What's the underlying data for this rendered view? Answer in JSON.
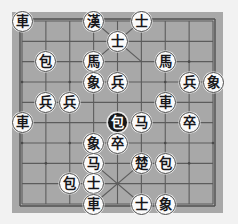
{
  "app": {
    "title": "Xiangqi Board",
    "background_color": "#f2f2f2"
  },
  "board": {
    "name": "xiangqi-board",
    "columns": 9,
    "rows": 10,
    "board_color": "#a8a8a8",
    "line_color": "#5c5c5c",
    "border_color": "#4f4f4f",
    "x": 12,
    "y": 12,
    "width": 211,
    "height": 201,
    "palaces": [
      {
        "name": "top-palace",
        "col_start": 3,
        "col_end": 5,
        "row_start": 0,
        "row_end": 2
      },
      {
        "name": "bottom-palace",
        "col_start": 3,
        "col_end": 5,
        "row_start": 7,
        "row_end": 9
      }
    ],
    "star_points": [
      {
        "col": 1,
        "row": 2
      },
      {
        "col": 7,
        "row": 2
      },
      {
        "col": 0,
        "row": 3
      },
      {
        "col": 2,
        "row": 3
      },
      {
        "col": 4,
        "row": 3
      },
      {
        "col": 6,
        "row": 3
      },
      {
        "col": 8,
        "row": 3
      },
      {
        "col": 0,
        "row": 6
      },
      {
        "col": 2,
        "row": 6
      },
      {
        "col": 4,
        "row": 6
      },
      {
        "col": 6,
        "row": 6
      },
      {
        "col": 8,
        "row": 6
      },
      {
        "col": 1,
        "row": 7
      },
      {
        "col": 7,
        "row": 7
      }
    ]
  },
  "pieces": [
    {
      "id": "p01",
      "glyph": "車",
      "role": "chariot",
      "side": "light",
      "selected": false,
      "col": 0,
      "row": 0
    },
    {
      "id": "p02",
      "glyph": "漢",
      "role": "general-han",
      "side": "light",
      "selected": false,
      "col": 3,
      "row": 0
    },
    {
      "id": "p03",
      "glyph": "士",
      "role": "advisor",
      "side": "light",
      "selected": false,
      "col": 5,
      "row": 0
    },
    {
      "id": "p04",
      "glyph": "士",
      "role": "advisor",
      "side": "light",
      "selected": false,
      "col": 4,
      "row": 1
    },
    {
      "id": "p05",
      "glyph": "包",
      "role": "cannon",
      "side": "light",
      "selected": false,
      "col": 1,
      "row": 2
    },
    {
      "id": "p06",
      "glyph": "馬",
      "role": "horse",
      "side": "light",
      "selected": false,
      "col": 3,
      "row": 2
    },
    {
      "id": "p07",
      "glyph": "馬",
      "role": "horse",
      "side": "light",
      "selected": false,
      "col": 6,
      "row": 2
    },
    {
      "id": "p08",
      "glyph": "象",
      "role": "elephant",
      "side": "light",
      "selected": false,
      "col": 3,
      "row": 3
    },
    {
      "id": "p09",
      "glyph": "兵",
      "role": "soldier",
      "side": "light",
      "selected": false,
      "col": 4,
      "row": 3
    },
    {
      "id": "p10",
      "glyph": "兵",
      "role": "soldier",
      "side": "light",
      "selected": false,
      "col": 7,
      "row": 3
    },
    {
      "id": "p11",
      "glyph": "象",
      "role": "elephant",
      "side": "light",
      "selected": false,
      "col": 8,
      "row": 3
    },
    {
      "id": "p12",
      "glyph": "兵",
      "role": "soldier",
      "side": "light",
      "selected": false,
      "col": 1,
      "row": 4
    },
    {
      "id": "p13",
      "glyph": "兵",
      "role": "soldier",
      "side": "light",
      "selected": false,
      "col": 2,
      "row": 4
    },
    {
      "id": "p14",
      "glyph": "車",
      "role": "chariot",
      "side": "light",
      "selected": false,
      "col": 6,
      "row": 4
    },
    {
      "id": "p15",
      "glyph": "車",
      "role": "chariot",
      "side": "light",
      "selected": false,
      "col": 0,
      "row": 5
    },
    {
      "id": "p16",
      "glyph": "包",
      "role": "cannon",
      "side": "dark",
      "selected": true,
      "col": 4,
      "row": 5
    },
    {
      "id": "p17",
      "glyph": "马",
      "role": "horse",
      "side": "light",
      "selected": false,
      "col": 5,
      "row": 5
    },
    {
      "id": "p18",
      "glyph": "卒",
      "role": "pawn",
      "side": "light",
      "selected": false,
      "col": 7,
      "row": 5
    },
    {
      "id": "p19",
      "glyph": "象",
      "role": "elephant",
      "side": "light",
      "selected": false,
      "col": 3,
      "row": 6
    },
    {
      "id": "p20",
      "glyph": "卒",
      "role": "pawn",
      "side": "light",
      "selected": false,
      "col": 4,
      "row": 6
    },
    {
      "id": "p21",
      "glyph": "马",
      "role": "horse",
      "side": "light",
      "selected": false,
      "col": 3,
      "row": 7
    },
    {
      "id": "p22",
      "glyph": "楚",
      "role": "general-chu",
      "side": "light",
      "selected": false,
      "col": 5,
      "row": 7
    },
    {
      "id": "p23",
      "glyph": "包",
      "role": "cannon",
      "side": "light",
      "selected": false,
      "col": 6,
      "row": 7
    },
    {
      "id": "p24",
      "glyph": "包",
      "role": "cannon",
      "side": "light",
      "selected": false,
      "col": 2,
      "row": 8
    },
    {
      "id": "p25",
      "glyph": "士",
      "role": "advisor",
      "side": "light",
      "selected": false,
      "col": 3,
      "row": 8
    },
    {
      "id": "p26",
      "glyph": "車",
      "role": "chariot",
      "side": "light",
      "selected": false,
      "col": 3,
      "row": 9
    },
    {
      "id": "p27",
      "glyph": "士",
      "role": "advisor",
      "side": "light",
      "selected": false,
      "col": 5,
      "row": 9
    },
    {
      "id": "p28",
      "glyph": "象",
      "role": "elephant",
      "side": "light",
      "selected": false,
      "col": 6,
      "row": 9
    }
  ]
}
